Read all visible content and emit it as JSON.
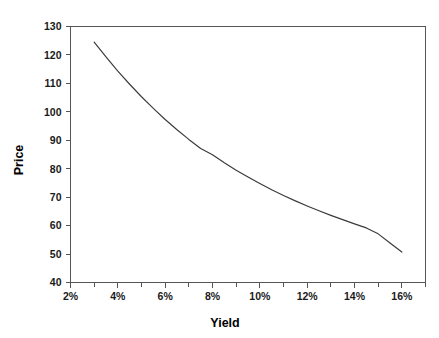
{
  "chart_data": {
    "type": "line",
    "title": "",
    "xlabel": "Yield",
    "ylabel": "Price",
    "xlim": [
      2,
      17
    ],
    "ylim": [
      40,
      130
    ],
    "grid": false,
    "legend": null,
    "x_tick_labels": [
      "2%",
      "4%",
      "6%",
      "8%",
      "10%",
      "12%",
      "14%",
      "16%"
    ],
    "x_tick_values": [
      2,
      4,
      6,
      8,
      10,
      12,
      14,
      16
    ],
    "x_minor_tick_values": [
      3,
      5,
      7,
      9,
      11,
      13,
      15,
      17
    ],
    "y_tick_labels": [
      "40",
      "50",
      "60",
      "70",
      "80",
      "90",
      "100",
      "110",
      "120",
      "130"
    ],
    "y_tick_values": [
      40,
      50,
      60,
      70,
      80,
      90,
      100,
      110,
      120,
      130
    ],
    "series": [
      {
        "name": "Price",
        "color": "#3a3a3a",
        "x": [
          3.0,
          3.5,
          4.0,
          4.5,
          5.0,
          5.5,
          6.0,
          6.5,
          7.0,
          7.5,
          8.0,
          8.5,
          9.0,
          9.5,
          10.0,
          10.5,
          11.0,
          11.5,
          12.0,
          12.5,
          13.0,
          13.5,
          14.0,
          14.5,
          15.0,
          15.5,
          16.0
        ],
        "values": [
          124.5,
          119.3,
          114.3,
          109.7,
          105.3,
          101.2,
          97.3,
          93.7,
          90.3,
          87.1,
          84.9,
          82.1,
          79.5,
          77.1,
          74.8,
          72.6,
          70.6,
          68.7,
          66.9,
          65.2,
          63.6,
          62.1,
          60.6,
          59.2,
          57.1,
          53.9,
          50.7
        ]
      }
    ]
  },
  "axis_titles": {
    "x": "Yield",
    "y": "Price"
  }
}
